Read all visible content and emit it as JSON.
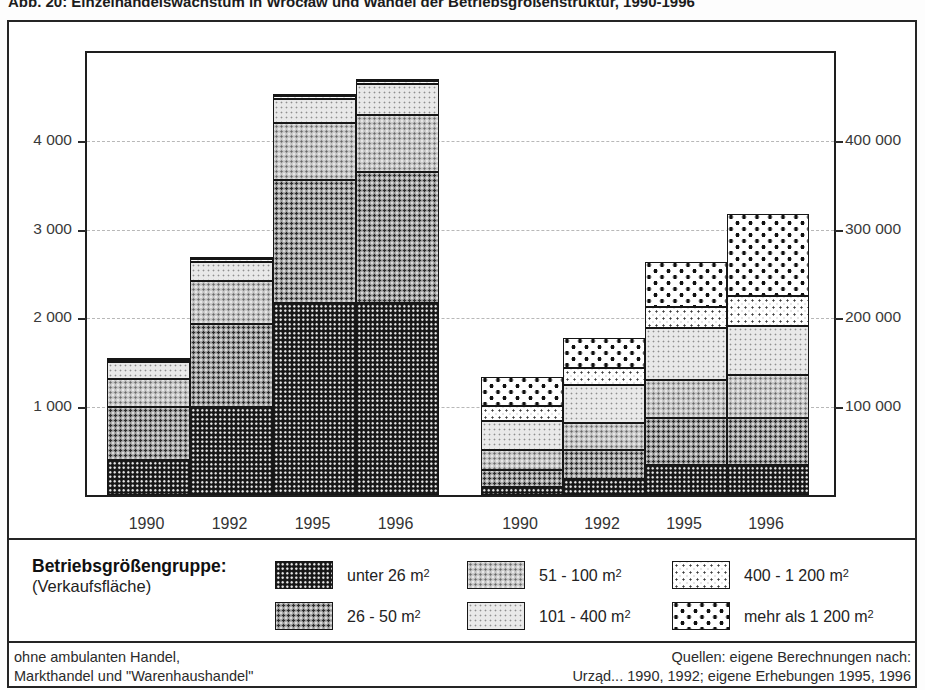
{
  "title": "Abb. 20: Einzelhandelswachstum in Wrocław und Wandel der Betriebsgrößenstruktur, 1990-1996",
  "chart_data": {
    "type": "bar",
    "stacked": true,
    "grid": "horizontal-dashed",
    "categories": [
      "1990",
      "1992",
      "1995",
      "1996"
    ],
    "groups": [
      {
        "name": "Anzahl Geschäfte",
        "axis_side": "left",
        "ylim": [
          0,
          5000
        ],
        "axis_ticks": [
          1000,
          2000,
          3000,
          4000
        ],
        "axis_tick_labels": [
          "1 000",
          "2 000",
          "3 000",
          "4 000"
        ],
        "categories": [
          "1990",
          "1992",
          "1995",
          "1996"
        ],
        "totals": [
          1540,
          2675,
          4525,
          4695
        ],
        "series": [
          {
            "name": "unter 26 m²",
            "values": [
              400,
              990,
              2170,
              2170
            ]
          },
          {
            "name": "26 - 50 m²",
            "values": [
              600,
              940,
              1390,
              1480
            ]
          },
          {
            "name": "51 - 100 m²",
            "values": [
              310,
              490,
              650,
              650
            ]
          },
          {
            "name": "101 - 400 m²",
            "values": [
              200,
              220,
              270,
              345
            ]
          },
          {
            "name": "400 - 1 200 m²",
            "values": [
              20,
              25,
              30,
              35
            ]
          },
          {
            "name": "mehr als 1 200 m²",
            "values": [
              10,
              10,
              15,
              15
            ]
          }
        ]
      },
      {
        "name": "Verkaufsfläche in m²",
        "axis_side": "right",
        "ylim": [
          0,
          500000
        ],
        "axis_ticks": [
          100000,
          200000,
          300000,
          400000
        ],
        "axis_tick_labels": [
          "100 000",
          "200 000",
          "300 000",
          "400 000"
        ],
        "categories": [
          "1990",
          "1992",
          "1995",
          "1996"
        ],
        "totals": [
          133500,
          177500,
          264000,
          318000
        ],
        "series": [
          {
            "name": "unter 26 m²",
            "values": [
              9000,
              18000,
              34000,
              34000
            ]
          },
          {
            "name": "26 - 50 m²",
            "values": [
              19500,
              33000,
              53000,
              53000
            ]
          },
          {
            "name": "51 - 100 m²",
            "values": [
              22500,
              31000,
              43000,
              49000
            ]
          },
          {
            "name": "101 - 400 m²",
            "values": [
              33000,
              42500,
              58500,
              55000
            ]
          },
          {
            "name": "400 - 1 200 m²",
            "values": [
              16500,
              19000,
              24000,
              34000
            ]
          },
          {
            "name": "mehr als 1 200 m²",
            "values": [
              33000,
              34000,
              51500,
              93000
            ]
          }
        ]
      }
    ]
  },
  "headers": {
    "left": "Anzahl Geschäfte",
    "right_prefix": "Verkaufsfläche in m",
    "right_sup": "2"
  },
  "legend": {
    "title": "Betriebsgrößengruppe:",
    "subtitle": "(Verkaufsfläche)",
    "items": [
      {
        "label": "unter 26 m",
        "sup": "2",
        "pattern": 0
      },
      {
        "label": "26 - 50 m",
        "sup": "2",
        "pattern": 1
      },
      {
        "label": "51 - 100 m",
        "sup": "2",
        "pattern": 2
      },
      {
        "label": "101 - 400 m",
        "sup": "2",
        "pattern": 3
      },
      {
        "label": "400 - 1 200 m",
        "sup": "2",
        "pattern": 4
      },
      {
        "label": "mehr als 1 200 m",
        "sup": "2",
        "pattern": 5
      }
    ]
  },
  "footnotes": {
    "left_line1": "ohne ambulanten Handel,",
    "left_line2": "Markthandel und \"Warenhaushandel\"",
    "right_line1": "Quellen: eigene Berechnungen nach:",
    "right_line2": "Urząd... 1990, 1992; eigene Erhebungen 1995, 1996"
  },
  "colors": {
    "frame": "#252525",
    "grid": "#b8b8b8",
    "ink": "#161616"
  }
}
